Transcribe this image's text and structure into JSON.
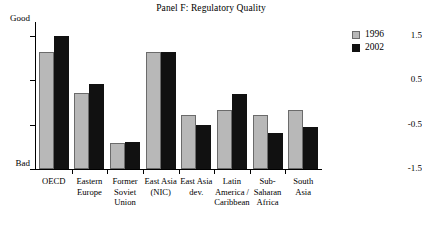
{
  "chart": {
    "title": "Panel F: Regulatory Quality",
    "y_axis": {
      "top_caption": "Good",
      "bottom_caption": "Bad",
      "ticks": [
        "1.5",
        "0.5",
        "-0.5",
        "-1.5"
      ]
    },
    "legend": [
      {
        "label": "1996",
        "color": "#b8b8b8",
        "name": "legend-1996"
      },
      {
        "label": "2002",
        "color": "#111111",
        "name": "legend-2002"
      }
    ]
  },
  "chart_data": {
    "type": "bar",
    "title": "Panel F: Regulatory Quality",
    "xlabel": "",
    "ylabel": "",
    "ylim": [
      -1.5,
      2.0
    ],
    "yticks": [
      1.5,
      0.5,
      -0.5,
      -1.5
    ],
    "ytick_labels": [
      "1.5",
      "0.5",
      "-0.5",
      "-1.5"
    ],
    "y_axis_top_caption": "Good",
    "y_axis_bottom_caption": "Bad",
    "grid": false,
    "legend_position": "top-right",
    "baseline": -1.5,
    "categories": [
      "OECD",
      "Eastern Europe",
      "Former Soviet Union",
      "East Asia (NIC)",
      "East Asia dev.",
      "Latin America / Caribbean",
      "Sub-Saharan Africa",
      "South Asia"
    ],
    "category_lines": [
      [
        "OECD"
      ],
      [
        "Eastern",
        "Europe"
      ],
      [
        "Former",
        "Soviet",
        "Union"
      ],
      [
        "East Asia",
        "(NIC)"
      ],
      [
        "East Asia",
        "dev."
      ],
      [
        "Latin",
        "America /",
        "Caribbean"
      ],
      [
        "Sub-",
        "Saharan",
        "Africa"
      ],
      [
        "South",
        "Asia"
      ]
    ],
    "series": [
      {
        "name": "1996",
        "color": "#b8b8b8",
        "values": [
          1.15,
          0.22,
          -0.92,
          1.15,
          -0.28,
          -0.18,
          -0.28,
          -0.18
        ]
      },
      {
        "name": "2002",
        "color": "#111111",
        "values": [
          1.5,
          0.42,
          -0.88,
          1.15,
          -0.5,
          0.2,
          -0.68,
          -0.55
        ]
      }
    ]
  }
}
